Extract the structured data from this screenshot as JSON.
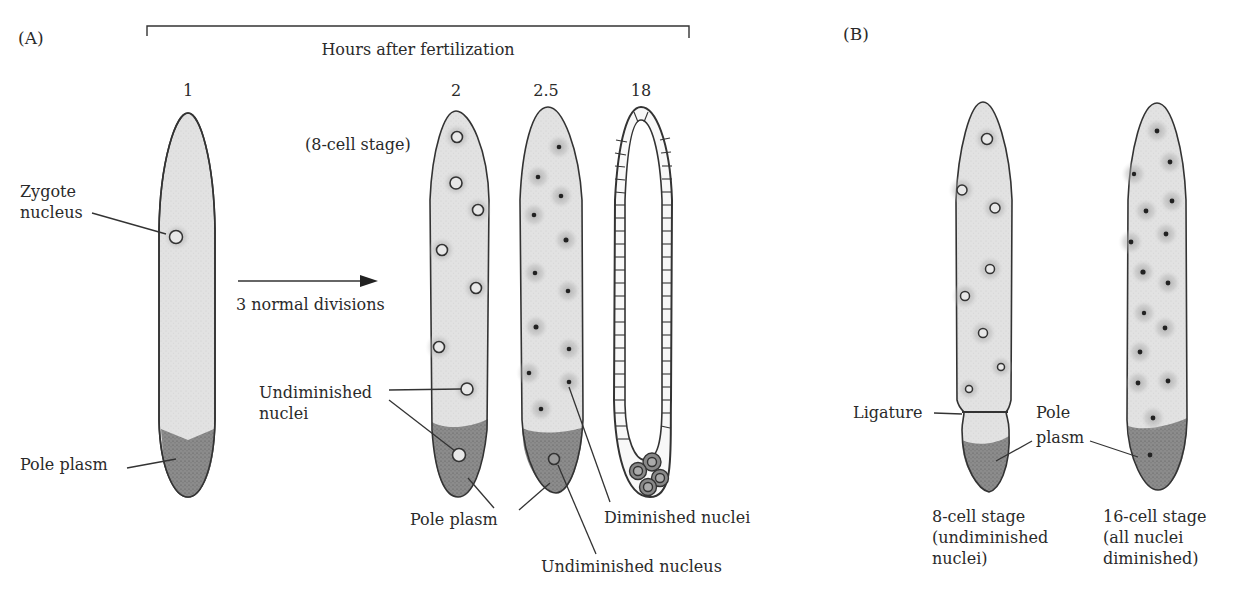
{
  "figure": {
    "panels": [
      {
        "id": "A",
        "label": "(A)"
      },
      {
        "id": "B",
        "label": "(B)"
      }
    ],
    "timeline": {
      "title": "Hours after fertilization",
      "times": [
        "1",
        "2",
        "2.5",
        "18"
      ]
    },
    "panel_a": {
      "stage_note": "(8-cell stage)",
      "arrow_label": "3 normal divisions",
      "labels": {
        "zygote_nucleus_line1": "Zygote",
        "zygote_nucleus_line2": "nucleus",
        "pole_plasm_left": "Pole plasm",
        "undiminished_nuclei_line1": "Undiminished",
        "undiminished_nuclei_line2": "nuclei",
        "pole_plasm_mid": "Pole plasm",
        "diminished_nuclei": "Diminished nuclei",
        "undiminished_nucleus": "Undiminished nucleus"
      }
    },
    "panel_b": {
      "labels": {
        "ligature": "Ligature",
        "pole_plasm_line1": "Pole",
        "pole_plasm_line2": "plasm"
      },
      "captions": [
        {
          "lines": [
            "8-cell stage",
            "(undiminished",
            "nuclei)"
          ]
        },
        {
          "lines": [
            "16-cell stage",
            "(all nuclei",
            "diminished)"
          ]
        }
      ]
    },
    "colors": {
      "cytoplasm": "#e4e4e4",
      "pole_plasm": "#8a8a8a",
      "outline": "#333333"
    }
  }
}
